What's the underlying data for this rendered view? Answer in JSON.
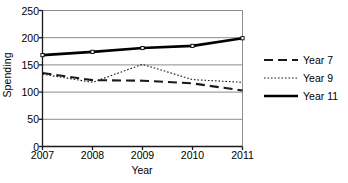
{
  "chart_data": {
    "type": "line",
    "title": "",
    "xlabel": "Year",
    "ylabel": "Spending",
    "categories": [
      "2007",
      "2008",
      "2009",
      "2010",
      "2011"
    ],
    "x": [
      2007,
      2008,
      2009,
      2010,
      2011
    ],
    "ylim": [
      0,
      250
    ],
    "yticks": [
      0,
      50,
      100,
      150,
      200,
      250
    ],
    "ytick_labels": [
      "0",
      "50",
      "100",
      "150",
      "200",
      "250"
    ],
    "grid": "horizontal",
    "legend_position": "right",
    "series": [
      {
        "name": "Year 7",
        "values": [
          135,
          122,
          121,
          116,
          103
        ],
        "style": "dashed",
        "color": "#1a1a1a",
        "width": 2.1,
        "markers": false
      },
      {
        "name": "Year 9",
        "values": [
          133,
          118,
          151,
          123,
          118
        ],
        "style": "dotted",
        "color": "#1a1a1a",
        "width": 1.1,
        "markers": false
      },
      {
        "name": "Year 11",
        "values": [
          168,
          174,
          181,
          185,
          199
        ],
        "style": "solid",
        "color": "#000000",
        "width": 2.6,
        "markers": true
      }
    ]
  },
  "axes": {
    "y_title": "Spending",
    "x_title": "Year"
  },
  "legend": {
    "entries": [
      {
        "label": "Year 7"
      },
      {
        "label": "Year 9"
      },
      {
        "label": "Year 11"
      }
    ]
  },
  "colors": {
    "axis": "#1a1a1a",
    "grid": "#8c8c8c",
    "series_line": "#111111",
    "background": "#ffffff"
  }
}
